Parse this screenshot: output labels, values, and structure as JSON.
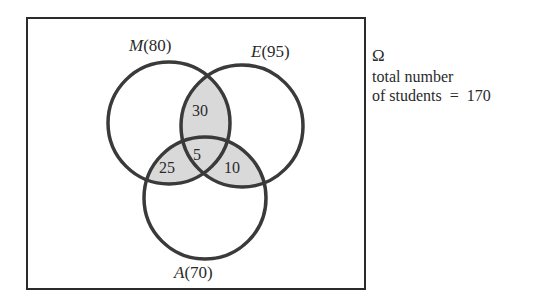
{
  "diagram": {
    "type": "venn-3-set",
    "universe": {
      "symbol": "Ω",
      "note_line1": "total number",
      "note_line2_prefix": "of students",
      "note_line2_eq": "=",
      "total": "170"
    },
    "sets": [
      {
        "id": "M",
        "letter": "M",
        "count_text": "(80)",
        "count": 80
      },
      {
        "id": "E",
        "letter": "E",
        "count_text": "(95)",
        "count": 95
      },
      {
        "id": "A",
        "letter": "A",
        "count_text": "(70)",
        "count": 70
      }
    ],
    "regions": {
      "M_and_E_only": "30",
      "M_and_A_only": "25",
      "E_and_A_only": "10",
      "M_E_A": "5"
    },
    "colors": {
      "stroke": "#3a3a3a",
      "shade": "#d9d9d9",
      "background": "#ffffff"
    }
  }
}
